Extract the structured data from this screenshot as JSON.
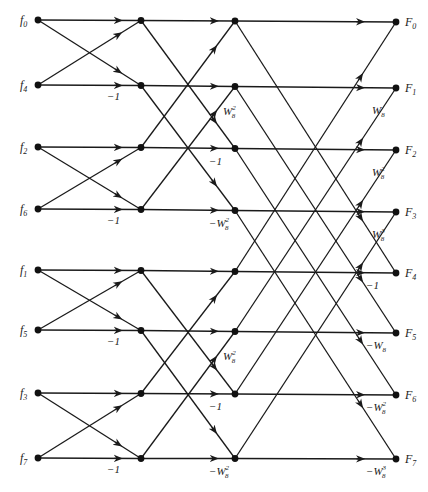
{
  "diagram": {
    "inputs": [
      {
        "name": "f",
        "sub": "0"
      },
      {
        "name": "f",
        "sub": "4"
      },
      {
        "name": "f",
        "sub": "2"
      },
      {
        "name": "f",
        "sub": "6"
      },
      {
        "name": "f",
        "sub": "1"
      },
      {
        "name": "f",
        "sub": "5"
      },
      {
        "name": "f",
        "sub": "3"
      },
      {
        "name": "f",
        "sub": "7"
      }
    ],
    "outputs": [
      {
        "name": "F",
        "sub": "0"
      },
      {
        "name": "F",
        "sub": "1"
      },
      {
        "name": "F",
        "sub": "2"
      },
      {
        "name": "F",
        "sub": "3"
      },
      {
        "name": "F",
        "sub": "4"
      },
      {
        "name": "F",
        "sub": "5"
      },
      {
        "name": "F",
        "sub": "6"
      },
      {
        "name": "F",
        "sub": "7"
      }
    ],
    "stage1_weights": [
      {
        "row": 1,
        "text": "−1",
        "base": "",
        "sup": ""
      },
      {
        "row": 3,
        "text": "−1",
        "base": "",
        "sup": ""
      },
      {
        "row": 5,
        "text": "−1",
        "base": "",
        "sup": ""
      },
      {
        "row": 7,
        "text": "−1",
        "base": "",
        "sup": ""
      }
    ],
    "stage2_weights": [
      {
        "row": 1,
        "kind": "cross",
        "prefix": "",
        "sup": "2"
      },
      {
        "row": 2,
        "kind": "straight",
        "prefix": "−1",
        "sup": ""
      },
      {
        "row": 3,
        "kind": "straight",
        "prefix": "−W",
        "sup": "2"
      },
      {
        "row": 5,
        "kind": "cross",
        "prefix": "",
        "sup": "2"
      },
      {
        "row": 6,
        "kind": "straight",
        "prefix": "−1",
        "sup": ""
      },
      {
        "row": 7,
        "kind": "straight",
        "prefix": "−W",
        "sup": "2"
      }
    ],
    "stage3_weights": [
      {
        "row": 1,
        "kind": "cross",
        "prefix": "",
        "sup": ""
      },
      {
        "row": 2,
        "kind": "cross",
        "prefix": "",
        "sup": "2"
      },
      {
        "row": 3,
        "kind": "cross",
        "prefix": "",
        "sup": "3"
      },
      {
        "row": 4,
        "kind": "straight",
        "prefix": "−1",
        "sup": ""
      },
      {
        "row": 5,
        "kind": "straight",
        "prefix": "−W",
        "sup": ""
      },
      {
        "row": 6,
        "kind": "straight",
        "prefix": "−W",
        "sup": "2"
      },
      {
        "row": 7,
        "kind": "straight",
        "prefix": "−W",
        "sup": "3"
      }
    ],
    "twiddle_base": "W",
    "twiddle_sub": "8"
  }
}
